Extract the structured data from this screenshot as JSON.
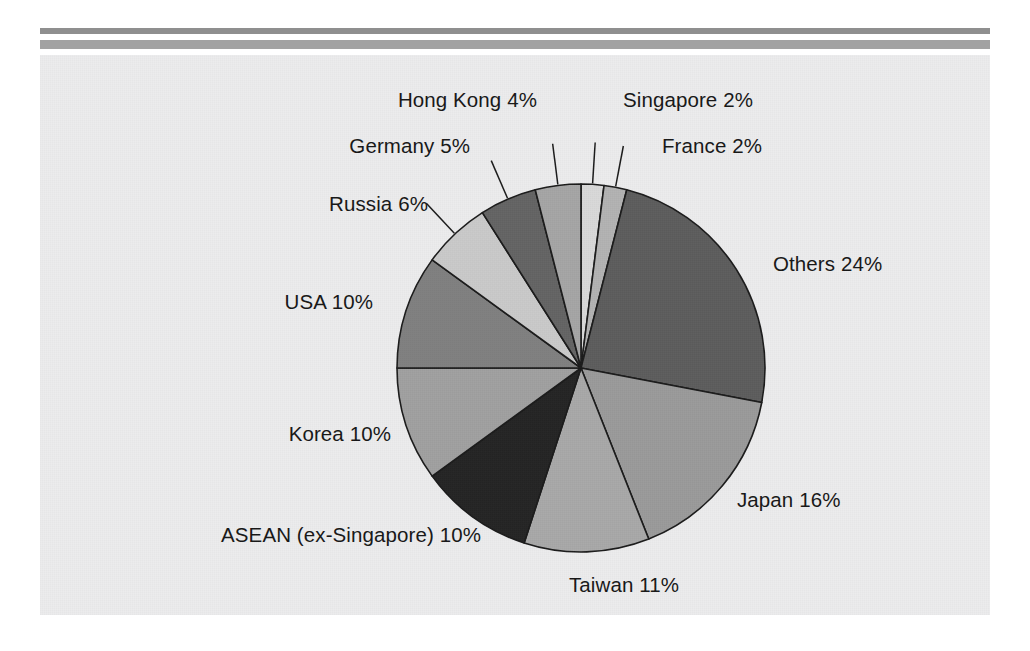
{
  "chart_data": {
    "type": "pie",
    "title": "",
    "subtitle": "",
    "xlabel": "",
    "ylabel": "",
    "legend_position": "none",
    "grid": false,
    "unit": "%",
    "categories": [
      "Singapore",
      "France",
      "Others",
      "Japan",
      "Taiwan",
      "ASEAN (ex-Singapore)",
      "Korea",
      "USA",
      "Russia",
      "Germany",
      "Hong Kong"
    ],
    "values": [
      2,
      2,
      24,
      16,
      11,
      10,
      10,
      10,
      6,
      5,
      4
    ],
    "total": 100,
    "slices": [
      {
        "label": "Singapore 2%",
        "name": "Singapore",
        "value": 2,
        "color": "#d9d9d9",
        "label_x": 583,
        "label_y": 52,
        "anchor": "start",
        "leader": true
      },
      {
        "label": "France 2%",
        "name": "France",
        "value": 2,
        "color": "#b2b2b2",
        "label_x": 622,
        "label_y": 98,
        "anchor": "start",
        "leader": true
      },
      {
        "label": "Others 24%",
        "name": "Others",
        "value": 24,
        "color": "#5c5c5c",
        "label_x": 733,
        "label_y": 216,
        "anchor": "start",
        "leader": false
      },
      {
        "label": "Japan 16%",
        "name": "Japan",
        "value": 16,
        "color": "#9a9a9a",
        "label_x": 697,
        "label_y": 452,
        "anchor": "start",
        "leader": false
      },
      {
        "label": "Taiwan 11%",
        "name": "Taiwan",
        "value": 11,
        "color": "#a8a8a8",
        "label_x": 584,
        "label_y": 537,
        "anchor": "middle",
        "leader": false
      },
      {
        "label": "ASEAN (ex-Singapore) 10%",
        "name": "ASEAN (ex-Singapore)",
        "value": 10,
        "color": "#232323",
        "label_x": 441,
        "label_y": 487,
        "anchor": "end",
        "leader": false
      },
      {
        "label": "Korea 10%",
        "name": "Korea",
        "value": 10,
        "color": "#a0a0a0",
        "label_x": 351,
        "label_y": 386,
        "anchor": "end",
        "leader": false
      },
      {
        "label": "USA 10%",
        "name": "USA",
        "value": 10,
        "color": "#7f7f7f",
        "label_x": 333,
        "label_y": 254,
        "anchor": "end",
        "leader": false
      },
      {
        "label": "Russia 6%",
        "name": "Russia",
        "value": 6,
        "color": "#c9c9c9",
        "label_x": 388,
        "label_y": 156,
        "anchor": "end",
        "leader": true
      },
      {
        "label": "Germany 5%",
        "name": "Germany",
        "value": 5,
        "color": "#636363",
        "label_x": 430,
        "label_y": 98,
        "anchor": "end",
        "leader": true
      },
      {
        "label": "Hong Kong 4%",
        "name": "Hong Kong",
        "value": 4,
        "color": "#a5a5a5",
        "label_x": 497,
        "label_y": 52,
        "anchor": "end",
        "leader": true
      }
    ],
    "geometry": {
      "center_x": 541,
      "center_y": 313,
      "radius": 184,
      "start_angle_deg": -90,
      "direction": "clockwise"
    },
    "colors": {
      "background": "#ececed",
      "page": "#ffffff",
      "stroke": "#1a1a1a",
      "rule": "#9a9a9a"
    }
  }
}
